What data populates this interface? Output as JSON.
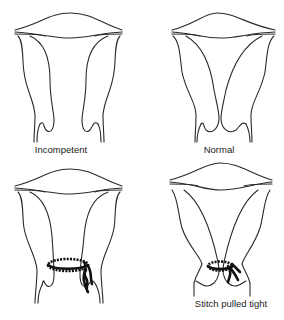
{
  "diagram": {
    "title": "",
    "panels": [
      {
        "id": "incompetent",
        "label": "Incompetent",
        "stitch": false
      },
      {
        "id": "normal",
        "label": "Normal",
        "stitch": false
      },
      {
        "id": "stitched",
        "label": "",
        "stitch": true
      },
      {
        "id": "stitch-tight",
        "label": "Stitch pulled tight",
        "stitch": true
      }
    ]
  },
  "colors": {
    "line": "#2a2a2a",
    "stitch": "#111111",
    "background": "#ffffff"
  }
}
